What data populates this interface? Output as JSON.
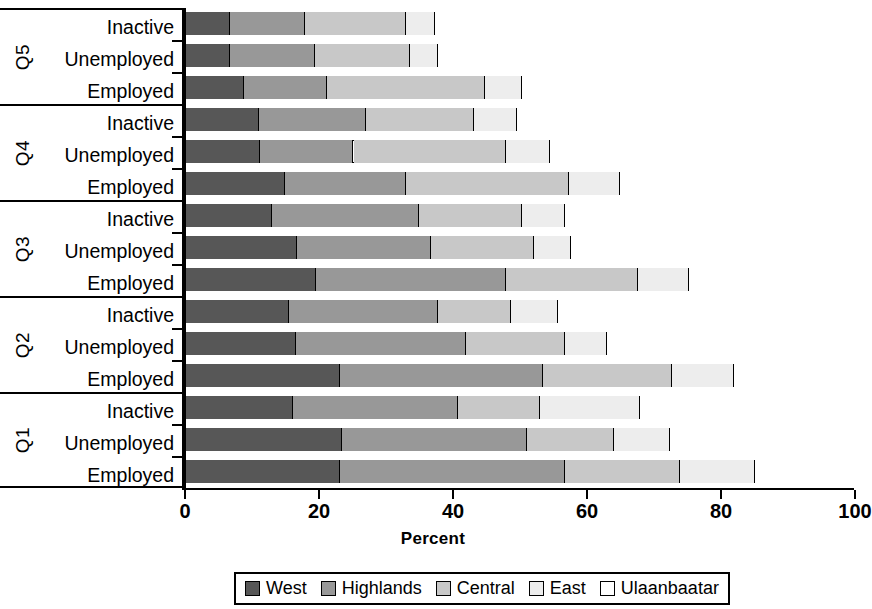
{
  "chart_data": {
    "type": "bar",
    "orientation": "horizontal",
    "stacked": true,
    "stack_total": 100,
    "title": "",
    "xlabel": "Percent",
    "ylabel": "",
    "xlim": [
      0,
      100
    ],
    "xticks": [
      0,
      20,
      40,
      60,
      80,
      100
    ],
    "xtick_labels": [
      "0",
      "20",
      "40",
      "60",
      "80",
      "100"
    ],
    "grid": false,
    "legend_position": "bottom",
    "series": [
      {
        "name": "West",
        "color": "#575757"
      },
      {
        "name": "Highlands",
        "color": "#989898"
      },
      {
        "name": "Central",
        "color": "#c8c8c8"
      },
      {
        "name": "East",
        "color": "#ededed"
      },
      {
        "name": "Ulaanbaatar",
        "color": "#ffffff"
      }
    ],
    "groups": [
      {
        "name": "Q5",
        "rows": [
          {
            "category": "Inactive",
            "values": [
              6.5,
              11.3,
              15.0,
              4.4,
              62.8
            ]
          },
          {
            "category": "Unemployed",
            "values": [
              6.6,
              12.6,
              14.3,
              4.1,
              62.4
            ]
          },
          {
            "category": "Employed",
            "values": [
              8.7,
              12.3,
              23.6,
              5.6,
              49.8
            ]
          }
        ]
      },
      {
        "name": "Q4",
        "rows": [
          {
            "category": "Inactive",
            "values": [
              10.9,
              16.0,
              16.1,
              6.4,
              50.6
            ]
          },
          {
            "category": "Unemployed",
            "values": [
              11.0,
              14.0,
              22.8,
              6.6,
              45.6
            ]
          },
          {
            "category": "Employed",
            "values": [
              14.8,
              18.1,
              24.2,
              7.7,
              35.2
            ]
          }
        ]
      },
      {
        "name": "Q3",
        "rows": [
          {
            "category": "Inactive",
            "values": [
              12.9,
              21.9,
              15.3,
              6.4,
              43.5
            ]
          },
          {
            "category": "Unemployed",
            "values": [
              16.5,
              20.0,
              15.5,
              5.4,
              42.6
            ]
          },
          {
            "category": "Employed",
            "values": [
              19.4,
              28.3,
              19.7,
              7.7,
              24.9
            ]
          }
        ]
      },
      {
        "name": "Q2",
        "rows": [
          {
            "category": "Inactive",
            "values": [
              15.3,
              22.3,
              10.9,
              7.0,
              44.5
            ]
          },
          {
            "category": "Unemployed",
            "values": [
              16.4,
              25.4,
              14.8,
              6.3,
              37.1
            ]
          },
          {
            "category": "Employed",
            "values": [
              23.0,
              30.3,
              19.3,
              9.2,
              18.2
            ]
          }
        ]
      },
      {
        "name": "Q1",
        "rows": [
          {
            "category": "Inactive",
            "values": [
              15.9,
              24.7,
              12.2,
              15.0,
              32.2
            ]
          },
          {
            "category": "Unemployed",
            "values": [
              23.3,
              27.6,
              13.0,
              8.4,
              27.7
            ]
          },
          {
            "category": "Employed",
            "values": [
              23.0,
              33.6,
              17.1,
              11.2,
              15.1
            ]
          }
        ]
      }
    ]
  },
  "axis": {
    "x_title": "Percent"
  },
  "legend": {
    "items": [
      {
        "label": "West",
        "swatch": "legend-swatch-west"
      },
      {
        "label": "Highlands",
        "swatch": "legend-swatch-highlands"
      },
      {
        "label": "Central",
        "swatch": "legend-swatch-central"
      },
      {
        "label": "East",
        "swatch": "legend-swatch-east"
      },
      {
        "label": "Ulaanbaatar",
        "swatch": "legend-swatch-ulaanbaatar"
      }
    ]
  }
}
